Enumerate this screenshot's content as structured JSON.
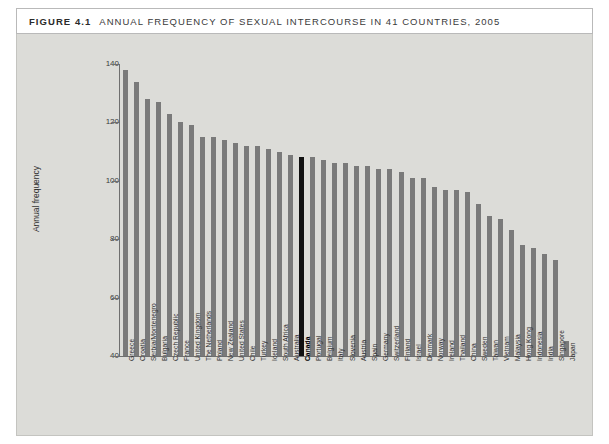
{
  "figure": {
    "number": "FIGURE 4.1",
    "title": "ANNUAL FREQUENCY OF SEXUAL INTERCOURSE IN 41 COUNTRIES, 2005"
  },
  "colors": {
    "bar": "#7a7a7a",
    "highlight_bar": "#111111",
    "panel_background": "#dcdcd8",
    "header_background": "#ffffff",
    "axis": "#6f6f6f"
  },
  "chart_data": {
    "type": "bar",
    "title": "ANNUAL FREQUENCY OF SEXUAL INTERCOURSE IN 41 COUNTRIES, 2005",
    "xlabel": "",
    "ylabel": "Annual frequency",
    "ylim": [
      40,
      140
    ],
    "yticks": [
      40,
      60,
      80,
      100,
      120,
      140
    ],
    "grid": false,
    "legend": false,
    "highlight_category": "Canada",
    "categories": [
      "Greece",
      "Croatia",
      "Serbia/Montenegro",
      "Bulgaria",
      "Czech Republic",
      "France",
      "United Kingdom",
      "The Netherlands",
      "Poland",
      "New Zealand",
      "United States",
      "Chile",
      "Turkey",
      "Iceland",
      "South Africa",
      "Australia",
      "Canada",
      "Portugal",
      "Belgium",
      "Italy",
      "Slovenia",
      "Austria",
      "Spain",
      "Germany",
      "Switzerland",
      "Finland",
      "Israel",
      "Denmark",
      "Norway",
      "Ireland",
      "Thailand",
      "China",
      "Sweden",
      "Taiwan",
      "Vietnam",
      "Malaysia",
      "Hong Kong",
      "Indonesia",
      "India",
      "Singapore",
      "Japan"
    ],
    "values": [
      138,
      134,
      128,
      127,
      123,
      120,
      119,
      115,
      115,
      114,
      113,
      112,
      112,
      111,
      110,
      109,
      108,
      108,
      107,
      106,
      106,
      105,
      105,
      104,
      104,
      103,
      101,
      101,
      98,
      97,
      97,
      96,
      92,
      88,
      87,
      83,
      78,
      77,
      75,
      73,
      45
    ]
  }
}
